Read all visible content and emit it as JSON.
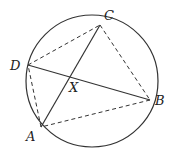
{
  "diagram": {
    "type": "cyclic-quadrilateral",
    "circle": {
      "cx": 92,
      "cy": 81,
      "r": 66
    },
    "points": {
      "A": {
        "label": "A",
        "x": 41,
        "y": 127
      },
      "B": {
        "label": "B",
        "x": 150,
        "y": 100
      },
      "C": {
        "label": "C",
        "x": 100,
        "y": 25
      },
      "D": {
        "label": "D",
        "x": 28,
        "y": 65
      },
      "X": {
        "label": "X",
        "x": 71,
        "y": 77
      }
    },
    "solid_segments": [
      [
        "A",
        "C"
      ],
      [
        "D",
        "B"
      ]
    ],
    "dashed_segments": [
      [
        "D",
        "C"
      ],
      [
        "C",
        "B"
      ],
      [
        "B",
        "A"
      ],
      [
        "A",
        "D"
      ]
    ],
    "intersection": "X",
    "stroke_color": "#333333"
  }
}
